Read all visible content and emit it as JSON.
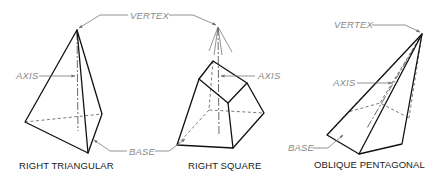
{
  "diagram": {
    "figures": [
      {
        "id": "right-triangular",
        "caption": "RIGHT TRIANGULAR"
      },
      {
        "id": "right-square",
        "caption": "RIGHT SQUARE"
      },
      {
        "id": "oblique-pentagonal",
        "caption": "OBLIQUE PENTAGONAL"
      }
    ],
    "callouts": {
      "vertex_shared": "VERTEX",
      "axis_triangular": "AXIS",
      "axis_square": "AXIS",
      "base_shared": "BASE",
      "vertex_oblique": "VERTEX",
      "axis_oblique": "AXIS",
      "base_oblique": "BASE"
    },
    "colors": {
      "object_line": "#111111",
      "hidden_line": "#555555",
      "leader_line": "#777777",
      "callout_text": "#8a8a8a",
      "caption_text": "#1a1a1a"
    }
  }
}
